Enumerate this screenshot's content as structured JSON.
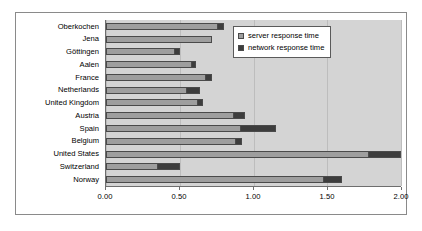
{
  "chart_data": {
    "type": "bar",
    "orientation": "horizontal",
    "stacked": true,
    "title": "",
    "xlabel": "",
    "ylabel": "",
    "xlim": [
      0,
      2
    ],
    "grid": true,
    "legend_position": "top-right",
    "tick_labels": [
      "0.00",
      "0.50",
      "1.00",
      "1.50",
      "2.00"
    ],
    "tick_values": [
      0,
      0.5,
      1.0,
      1.5,
      2.0
    ],
    "categories": [
      "Oberkochen",
      "Jena",
      "Göttingen",
      "Aalen",
      "France",
      "Netherlands",
      "United Kingdom",
      "Austria",
      "Spain",
      "Belgium",
      "United States",
      "Switzerland",
      "Norway"
    ],
    "series": [
      {
        "name": "server response time",
        "color": "#9e9e9e",
        "values": [
          0.76,
          0.72,
          0.47,
          0.58,
          0.68,
          0.55,
          0.62,
          0.87,
          0.91,
          0.88,
          1.78,
          0.35,
          1.48
        ]
      },
      {
        "name": "network response time",
        "color": "#3d3d3d",
        "values": [
          0.04,
          0.0,
          0.03,
          0.03,
          0.04,
          0.09,
          0.04,
          0.07,
          0.24,
          0.04,
          0.22,
          0.15,
          0.12
        ]
      }
    ],
    "totals": [
      0.8,
      0.72,
      0.5,
      0.61,
      0.72,
      0.64,
      0.66,
      0.94,
      1.15,
      0.92,
      2.0,
      0.5,
      1.6
    ]
  },
  "legend": {
    "items": [
      {
        "label": "server response time",
        "key": "server"
      },
      {
        "label": "network response time",
        "key": "network"
      }
    ]
  }
}
